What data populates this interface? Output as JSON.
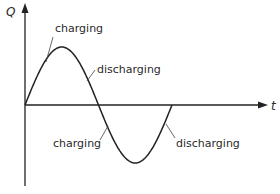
{
  "diagram": {
    "y_axis_label": "Q",
    "x_axis_label": "t",
    "curve": "sine",
    "cycles": 1,
    "annotations": [
      {
        "text": "charging",
        "phase": "first quarter (rising to positive peak)"
      },
      {
        "text": "discharging",
        "phase": "second quarter (falling to zero)"
      },
      {
        "text": "charging",
        "phase": "third quarter (falling to negative peak)"
      },
      {
        "text": "discharging",
        "phase": "fourth quarter (rising to zero)"
      }
    ]
  }
}
